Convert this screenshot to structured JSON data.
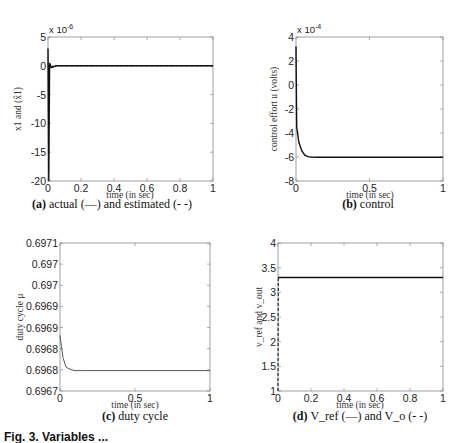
{
  "figure_caption_partial": "Fig. 3. Variables ...",
  "chart_data": [
    {
      "id": "a",
      "type": "line",
      "caption_label": "(a)",
      "caption_text": "actual (—) and estimated (- -)",
      "xlabel": "time (in sec)",
      "ylabel": "x1 and (x̂1)",
      "y_multiplier": "x 10^-6",
      "xlim": [
        0,
        1
      ],
      "ylim": [
        -20,
        5
      ],
      "xticks": [
        "0",
        "0.2",
        "0.4",
        "0.6",
        "0.8",
        "1"
      ],
      "yticks": [
        "5",
        "0",
        "-5",
        "-10",
        "-15",
        "-20"
      ],
      "grid": false,
      "series": [
        {
          "name": "actual",
          "style": "solid",
          "x": [
            0,
            0.005,
            0.01,
            0.02,
            0.05,
            1
          ],
          "y": [
            3,
            -20,
            0.5,
            -0.3,
            0,
            0
          ]
        },
        {
          "name": "estimated",
          "style": "dashed",
          "x": [
            0,
            0.01,
            0.03,
            1
          ],
          "y": [
            0,
            -0.5,
            0,
            0
          ]
        }
      ]
    },
    {
      "id": "b",
      "type": "line",
      "caption_label": "(b)",
      "caption_text": "control",
      "xlabel": "time (in sec)",
      "ylabel": "control effort u (volts)",
      "y_multiplier": "x 10^-4",
      "xlim": [
        0,
        1
      ],
      "ylim": [
        -8,
        4
      ],
      "xticks": [
        "0",
        "0.5",
        "1"
      ],
      "yticks": [
        "4",
        "2",
        "0",
        "-2",
        "-4",
        "-6",
        "-8"
      ],
      "grid": false,
      "series": [
        {
          "name": "u",
          "style": "solid",
          "x": [
            0,
            0.005,
            0.02,
            0.04,
            0.06,
            0.08,
            0.1,
            0.15,
            1
          ],
          "y": [
            3.2,
            -3.5,
            -4.8,
            -5.5,
            -5.85,
            -5.97,
            -6.0,
            -6.02,
            -6.02
          ]
        }
      ]
    },
    {
      "id": "c",
      "type": "line",
      "caption_label": "(c)",
      "caption_text": "duty cycle",
      "xlabel": "time (in sec)",
      "ylabel": "duty cycle μ",
      "xlim": [
        0,
        1
      ],
      "ylim": [
        0.6967,
        0.6971
      ],
      "xticks": [
        "0",
        "0.5",
        "1"
      ],
      "yticks": [
        "0.6971",
        "0.697",
        "0.697",
        "0.6969",
        "0.6969",
        "0.6968",
        "0.6968",
        "0.6967"
      ],
      "grid": false,
      "series": [
        {
          "name": "mu",
          "style": "solid",
          "x": [
            0,
            0.01,
            0.02,
            0.04,
            0.06,
            0.08,
            0.1,
            0.15,
            1
          ],
          "y": [
            0.69685,
            0.69682,
            0.69679,
            0.696765,
            0.69676,
            0.696757,
            0.696755,
            0.696755,
            0.696755
          ]
        }
      ]
    },
    {
      "id": "d",
      "type": "line",
      "caption_label": "(d)",
      "caption_text": "V_ref (—) and V_o (- -)",
      "xlabel": "time (in sec)",
      "ylabel": "v_ref and v_out",
      "xlim": [
        0,
        1
      ],
      "ylim": [
        1,
        4
      ],
      "xticks": [
        "0",
        "0.2",
        "0.4",
        "0.6",
        "0.8",
        "1"
      ],
      "yticks": [
        "4",
        "3.5",
        "3",
        "2.5",
        "2",
        "1.5",
        "1"
      ],
      "grid": false,
      "series": [
        {
          "name": "V_ref",
          "style": "solid",
          "x": [
            0,
            1
          ],
          "y": [
            3.3,
            3.3
          ]
        },
        {
          "name": "V_o",
          "style": "dashed",
          "x": [
            0,
            0.002,
            1
          ],
          "y": [
            1.0,
            3.3,
            3.3
          ]
        }
      ]
    }
  ]
}
